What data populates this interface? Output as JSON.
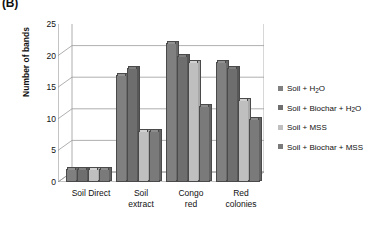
{
  "panel_label": "(B)",
  "chart_data": {
    "type": "bar",
    "title": "",
    "xlabel": "",
    "ylabel": "Number of bands",
    "ylim": [
      0,
      25
    ],
    "yticks": [
      0,
      5,
      10,
      15,
      20,
      25
    ],
    "grid": true,
    "legend_position": "right",
    "categories": [
      "Soil Direct",
      "Soil\nextract",
      "Congo\nred",
      "Red\ncolonies"
    ],
    "series": [
      {
        "name": "Soil + H2O",
        "label_html": "Soil + H|2|O",
        "color": "#808080",
        "values": [
          2,
          17,
          22,
          19
        ]
      },
      {
        "name": "Soil + Biochar + H2O",
        "label_html": "Soil + Biochar + H|2|O",
        "color": "#6E6E6E",
        "values": [
          2,
          18,
          20,
          18
        ]
      },
      {
        "name": "Soil + MSS",
        "label_html": "Soil + MSS",
        "color": "#BFBFBF",
        "values": [
          2,
          8,
          19,
          13
        ]
      },
      {
        "name": "Soil + Biochar + MSS",
        "label_html": "Soil + Biochar + MSS",
        "color": "#7A7A7A",
        "values": [
          2,
          8,
          12,
          10
        ]
      }
    ]
  },
  "axis_colors": {
    "gridline": "#9a9a9a",
    "axis": "#8a8a8a",
    "text": "#111111"
  }
}
